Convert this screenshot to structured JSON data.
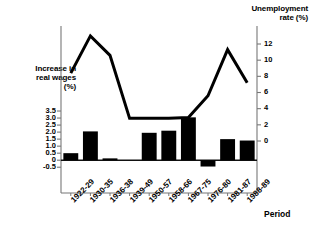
{
  "chart_data": {
    "type": "bar",
    "title": "",
    "xlabel": "Period",
    "categories": [
      "1922-29",
      "1930-35",
      "1936-38",
      "1939-49",
      "1950-57",
      "1958-66",
      "1967-75",
      "1976-80",
      "1981-87",
      "1988-89"
    ],
    "series": [
      {
        "name": "Increase in real wages (%)",
        "type": "bar",
        "axis": "left",
        "values": [
          0.5,
          2.05,
          0.13,
          0,
          1.95,
          2.1,
          3.05,
          -0.45,
          1.5,
          1.4
        ],
        "color": "#000000"
      },
      {
        "name": "Unemployment rate (%)",
        "type": "line",
        "axis": "right",
        "values": [
          8.4,
          13.0,
          10.6,
          2.8,
          2.8,
          2.8,
          2.9,
          5.6,
          11.3,
          7.2
        ],
        "color": "#000000"
      }
    ],
    "left_axis": {
      "label": "Increase in\nreal wages\n(%)",
      "label_lines": [
        "Increase in",
        "real wages",
        "(%)"
      ],
      "ticks": [
        "3.5",
        "3.0",
        "2.5",
        "2.0",
        "1.5",
        "1.0",
        "0.5",
        "0",
        "-0.5"
      ],
      "tick_values": [
        3.5,
        3.0,
        2.5,
        2.0,
        1.5,
        1.0,
        0.5,
        0,
        -0.5
      ],
      "ylim": [
        -0.5,
        3.5
      ]
    },
    "right_axis": {
      "label_lines": [
        "Unemployment",
        "rate (%)"
      ],
      "ticks": [
        "12",
        "10",
        "8",
        "6",
        "4",
        "2",
        "0"
      ],
      "tick_values": [
        12,
        10,
        8,
        6,
        4,
        2,
        0
      ],
      "ylim": [
        -2,
        14
      ]
    },
    "grid": false,
    "legend": "none"
  }
}
